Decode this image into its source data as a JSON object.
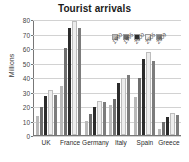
{
  "chart_data": {
    "type": "bar",
    "title": "Tourist arrivals",
    "xlabel": "",
    "ylabel": "Millions",
    "ylim": [
      0,
      80
    ],
    "yticks": [
      0,
      10,
      20,
      30,
      40,
      50,
      60,
      70,
      80
    ],
    "grid": true,
    "legend_position": "inside-top-right",
    "categories": [
      "UK",
      "France",
      "Germany",
      "Italy",
      "Spain",
      "Greece"
    ],
    "series": [
      {
        "name": "1990",
        "color": "#b9b9b9",
        "values": [
          13,
          34,
          10,
          21,
          26,
          4
        ]
      },
      {
        "name": "1995",
        "color": "#6e6e6e",
        "values": [
          19,
          60,
          14.5,
          25,
          39,
          9
        ]
      },
      {
        "name": "2000",
        "color": "#2b2b2b",
        "values": [
          27,
          74,
          19,
          36,
          52.5,
          12.5
        ]
      },
      {
        "name": "2005",
        "color": "#ededed",
        "values": [
          29.5,
          77,
          22,
          38,
          56,
          14
        ]
      },
      {
        "name": "2009",
        "color": "#7c7c7c",
        "values": [
          27.5,
          73.5,
          23,
          41.5,
          51,
          13.5
        ]
      }
    ]
  }
}
